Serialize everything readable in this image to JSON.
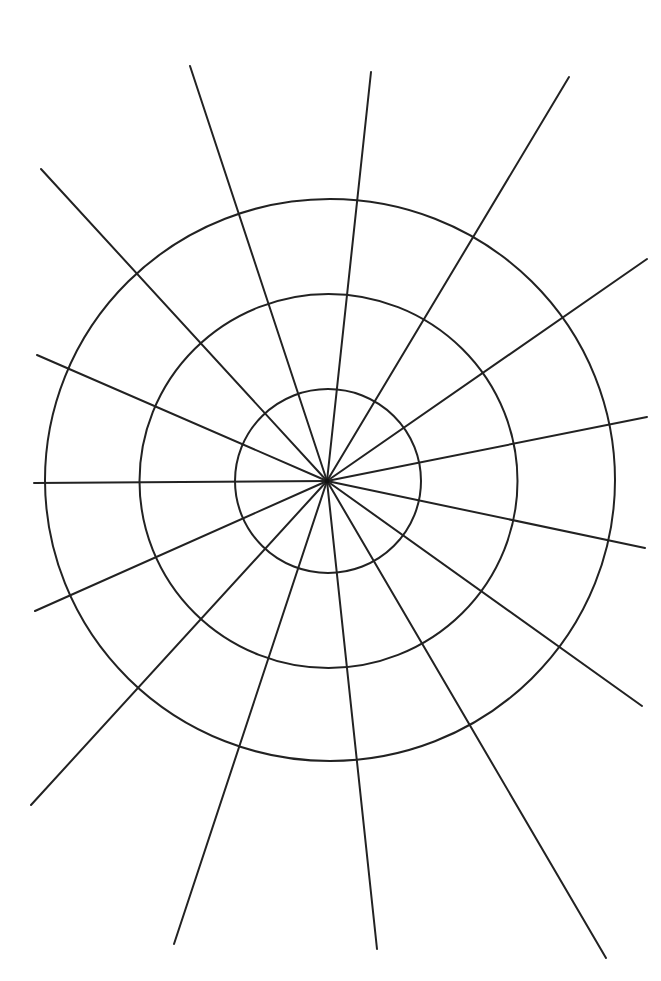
{
  "diagram": {
    "type": "polar-grid",
    "background": "#ffffff",
    "stroke_color": "#222222",
    "center": [
      327,
      481
    ],
    "rings": [
      {
        "cx": 328,
        "cy": 481,
        "rx": 93,
        "ry": 92
      },
      {
        "cx": 328.5,
        "cy": 481,
        "rx": 189,
        "ry": 187
      },
      {
        "cx": 330,
        "cy": 480,
        "rx": 285,
        "ry": 281
      }
    ],
    "spokes": [
      {
        "x": 190,
        "y": 66
      },
      {
        "x": 371,
        "y": 72
      },
      {
        "x": 569,
        "y": 77
      },
      {
        "x": 41,
        "y": 169
      },
      {
        "x": 647,
        "y": 259
      },
      {
        "x": 37,
        "y": 355
      },
      {
        "x": 647,
        "y": 417
      },
      {
        "x": 34,
        "y": 483
      },
      {
        "x": 645,
        "y": 548
      },
      {
        "x": 35,
        "y": 611
      },
      {
        "x": 642,
        "y": 706
      },
      {
        "x": 31,
        "y": 805
      },
      {
        "x": 174,
        "y": 944
      },
      {
        "x": 377,
        "y": 949
      },
      {
        "x": 606,
        "y": 958
      }
    ]
  }
}
